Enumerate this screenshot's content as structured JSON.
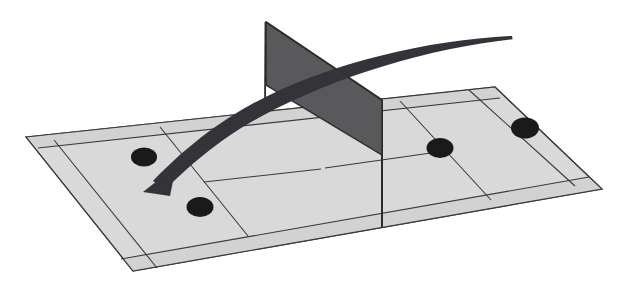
{
  "figure": {
    "background_color": "#ffffff",
    "width": 625,
    "height": 283
  },
  "court": {
    "name": "tennis-court",
    "surface_color": "#d9d9d9",
    "line_color": "#3a3a3a",
    "alley_color": "#d2d2d2",
    "corners": {
      "far_left": [
        26,
        137
      ],
      "far_right": [
        495,
        87
      ],
      "near_right": [
        602,
        189
      ],
      "near_left": [
        133,
        271
      ]
    },
    "lines": [
      {
        "name": "doubles-sideline-far",
        "label": "Far doubles sideline"
      },
      {
        "name": "singles-sideline-far",
        "label": "Far singles sideline"
      },
      {
        "name": "doubles-sideline-near",
        "label": "Near doubles sideline"
      },
      {
        "name": "singles-sideline-near",
        "label": "Near singles sideline"
      },
      {
        "name": "baseline-left",
        "label": "Left baseline"
      },
      {
        "name": "baseline-right",
        "label": "Right baseline"
      },
      {
        "name": "service-line-left",
        "label": "Left service line"
      },
      {
        "name": "service-line-right",
        "label": "Right service line"
      },
      {
        "name": "center-service-line-left",
        "label": "Left center service line"
      },
      {
        "name": "center-service-line-right",
        "label": "Right center service line"
      }
    ]
  },
  "net": {
    "name": "tennis-net",
    "fill_color": "#59595c",
    "edge_color": "#2b2b2b",
    "post_color": "#2b2b2b",
    "top_left": [
      266,
      22
    ],
    "top_right": [
      382,
      100
    ],
    "bottom_right": [
      382,
      155
    ],
    "bottom_left": [
      266,
      85
    ],
    "left_post_bottom": [
      265,
      108
    ],
    "right_post_bottom": [
      382,
      228
    ]
  },
  "trajectory": {
    "name": "ball-trajectory-arrow",
    "color": "#33333a",
    "start": [
      512,
      36
    ],
    "end": [
      147,
      187
    ],
    "arrowhead_at": "end",
    "description": "Curved arrow arcing over the net from the right court to the left court"
  },
  "markers": {
    "color": "#1a1a1a",
    "dots": [
      {
        "name": "ball-mark-1",
        "cx": 144,
        "cy": 157,
        "rx": 13,
        "ry": 9.5
      },
      {
        "name": "ball-mark-2",
        "cx": 200,
        "cy": 207,
        "rx": 13.5,
        "ry": 10
      },
      {
        "name": "ball-mark-3",
        "cx": 440,
        "cy": 148,
        "rx": 13.5,
        "ry": 10
      },
      {
        "name": "ball-mark-4",
        "cx": 525,
        "cy": 128,
        "rx": 14,
        "ry": 10.5
      }
    ]
  }
}
